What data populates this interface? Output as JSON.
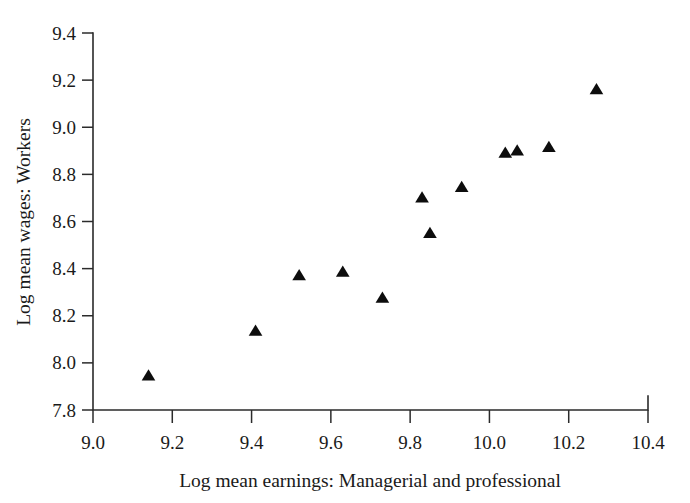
{
  "chart_data": {
    "type": "scatter",
    "title": "",
    "xlabel": "Log mean earnings: Managerial and professional",
    "ylabel": "Log mean wages: Workers",
    "xlim": [
      9.0,
      10.4
    ],
    "ylim": [
      7.8,
      9.4
    ],
    "xticks": [
      "9.0",
      "9.2",
      "9.4",
      "9.6",
      "9.8",
      "10.0",
      "10.2",
      "10.4"
    ],
    "xtick_values": [
      9.0,
      9.2,
      9.4,
      9.6,
      9.8,
      10.0,
      10.2,
      10.4
    ],
    "yticks": [
      "7.8",
      "8.0",
      "8.2",
      "8.4",
      "8.6",
      "8.8",
      "9.0",
      "9.2",
      "9.4"
    ],
    "ytick_values": [
      7.8,
      8.0,
      8.2,
      8.4,
      8.6,
      8.8,
      9.0,
      9.2,
      9.4
    ],
    "grid": false,
    "legend": false,
    "legend_position": "none",
    "marker": "triangle-up",
    "marker_color": "#0d0d0d",
    "marker_size": 11,
    "series": [
      {
        "name": "observations",
        "points": [
          {
            "x": 9.14,
            "y": 7.945
          },
          {
            "x": 9.41,
            "y": 8.135
          },
          {
            "x": 9.52,
            "y": 8.37
          },
          {
            "x": 9.63,
            "y": 8.385
          },
          {
            "x": 9.73,
            "y": 8.275
          },
          {
            "x": 9.83,
            "y": 8.7
          },
          {
            "x": 9.85,
            "y": 8.55
          },
          {
            "x": 9.93,
            "y": 8.745
          },
          {
            "x": 10.04,
            "y": 8.89
          },
          {
            "x": 10.07,
            "y": 8.9
          },
          {
            "x": 10.15,
            "y": 8.915
          },
          {
            "x": 10.27,
            "y": 9.16
          }
        ]
      }
    ]
  },
  "figure": {
    "background_color": "#ffffff",
    "axis_color": "#2b2b2b",
    "text_color": "#1a1a1a"
  }
}
